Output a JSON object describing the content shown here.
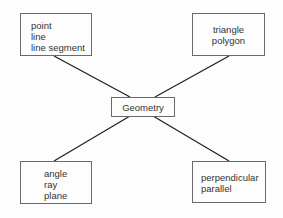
{
  "diagram": {
    "center": {
      "label": "Geometry"
    },
    "nodes": [
      {
        "position": "top-left",
        "items": [
          "point",
          "line",
          "line segment"
        ]
      },
      {
        "position": "top-right",
        "items": [
          "triangle",
          "polygon"
        ]
      },
      {
        "position": "bottom-left",
        "items": [
          "angle",
          "ray",
          "plane"
        ]
      },
      {
        "position": "bottom-right",
        "items": [
          "perpendicular",
          "parallel"
        ]
      }
    ]
  }
}
